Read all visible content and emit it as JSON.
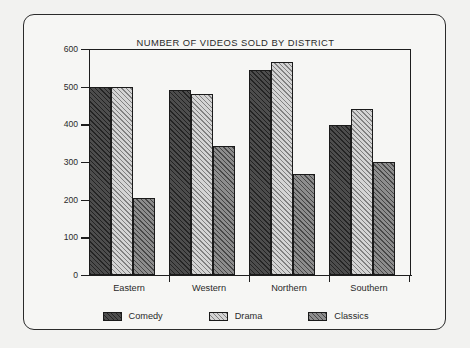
{
  "chart_data": {
    "type": "bar",
    "title": "NUMBER OF VIDEOS SOLD BY DISTRICT",
    "xlabel": "",
    "ylabel": "",
    "categories": [
      "Eastern",
      "Western",
      "Northern",
      "Southern"
    ],
    "series": [
      {
        "name": "Comedy",
        "values": [
          500,
          490,
          545,
          397
        ],
        "color": "#4d4d4d",
        "pattern": "diagonal-hatch-dark"
      },
      {
        "name": "Drama",
        "values": [
          500,
          480,
          565,
          440
        ],
        "color": "#d4d4d4",
        "pattern": "diagonal-hatch-light"
      },
      {
        "name": "Classics",
        "values": [
          205,
          342,
          268,
          300
        ],
        "color": "#8d8d8d",
        "pattern": "diagonal-hatch-medium"
      }
    ],
    "ylim": [
      0,
      600
    ],
    "ytick_labels": [
      "0",
      "100",
      "200",
      "300",
      "400",
      "500",
      "600"
    ],
    "ytick_values": [
      0,
      100,
      200,
      300,
      400,
      500,
      600
    ],
    "grid": false,
    "legend_position": "bottom"
  }
}
